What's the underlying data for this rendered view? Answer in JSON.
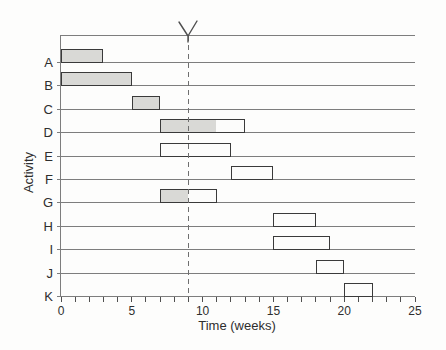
{
  "chart_data": {
    "type": "bar",
    "variant": "gantt",
    "title": "",
    "xlabel": "Time (weeks)",
    "ylabel": "Activity",
    "xlim": [
      0,
      25
    ],
    "x_major_ticks": [
      0,
      5,
      10,
      15,
      20,
      25
    ],
    "x_major_tick_labels": [
      "0",
      "5",
      "10",
      "15",
      "20",
      "25"
    ],
    "x_minor_tick_interval": 1,
    "current_time": {
      "week": 9,
      "line_style": "dashed",
      "marker": "Y-drop-arrow"
    },
    "categories": [
      "A",
      "B",
      "C",
      "D",
      "E",
      "F",
      "G",
      "H",
      "I",
      "J",
      "K"
    ],
    "bars": [
      {
        "activity": "A",
        "start": 0,
        "end": 3,
        "filled_to": 3
      },
      {
        "activity": "B",
        "start": 0,
        "end": 5,
        "filled_to": 5
      },
      {
        "activity": "C",
        "start": 5,
        "end": 7,
        "filled_to": 7
      },
      {
        "activity": "D",
        "start": 7,
        "end": 13,
        "filled_to": 11
      },
      {
        "activity": "E",
        "start": 7,
        "end": 12,
        "filled_to": 7
      },
      {
        "activity": "F",
        "start": 12,
        "end": 15,
        "filled_to": 12
      },
      {
        "activity": "G",
        "start": 7,
        "end": 11,
        "filled_to": 9
      },
      {
        "activity": "H",
        "start": 15,
        "end": 18,
        "filled_to": 15
      },
      {
        "activity": "I",
        "start": 15,
        "end": 19,
        "filled_to": 15
      },
      {
        "activity": "J",
        "start": 18,
        "end": 20,
        "filled_to": 18
      },
      {
        "activity": "K",
        "start": 20,
        "end": 22,
        "filled_to": 20
      }
    ],
    "colors": {
      "bar_fill": "#d9d9d6",
      "bar_border": "#3a3a3a",
      "bar_empty": "#fcfcfb",
      "line": "#7d7d7d",
      "tick": "#4f4f4f",
      "dashed": "#6f6f6f",
      "text": "#2e2e2e",
      "background": "#fdfdfc"
    }
  }
}
